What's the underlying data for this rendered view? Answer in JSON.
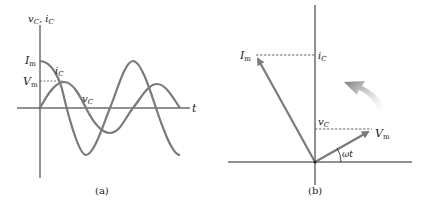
{
  "panel_a": {
    "caption": "(a)",
    "y_axis_label": "v",
    "y_axis_label_sub1": "C",
    "y_axis_label_sep": ", i",
    "y_axis_label_sub2": "C",
    "x_axis_label": "t",
    "current_peak_label": "I",
    "current_peak_sub": "m",
    "voltage_peak_label": "V",
    "voltage_peak_sub": "m",
    "current_curve_label": "i",
    "current_curve_sub": "C",
    "voltage_curve_label": "v",
    "voltage_curve_sub": "C"
  },
  "panel_b": {
    "caption": "(b)",
    "current_phasor_label": "I",
    "current_phasor_sub": "m",
    "voltage_phasor_label": "V",
    "voltage_phasor_sub": "m",
    "current_projection_label": "i",
    "current_projection_sub": "C",
    "voltage_projection_label": "v",
    "voltage_projection_sub": "C",
    "angle_label": "ωt",
    "rotation_direction": "counterclockwise"
  },
  "colors": {
    "curve": "#7a7a7a",
    "axis": "#222222",
    "rotation_arrow": "#8a8a8a"
  }
}
